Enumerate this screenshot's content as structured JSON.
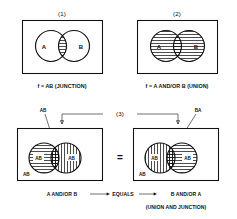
{
  "figure": {
    "title_number_1": "(1)",
    "title_number_2": "(2)",
    "title_number_3": "(3)",
    "panel1": {
      "number": "(1)",
      "circle_a_label": "A",
      "circle_b_label": "B",
      "caption": "f = AB (JUNCTION)",
      "shading": "intersection-only",
      "hatch_style": "horizontal"
    },
    "panel2": {
      "number": "(2)",
      "circle_a_label": "A",
      "circle_b_label": "B",
      "caption": "f = A AND/OR B (UNION)",
      "shading": "both-circles",
      "hatch_style": "horizontal"
    },
    "panel3": {
      "number": "(3)",
      "left_pointer_label": "AB",
      "right_pointer_label": "BA",
      "equals_symbol": "=",
      "left_box": {
        "circle_a_label": "AB",
        "circle_b_label": "AB",
        "corner_label": "AB",
        "circle_a_hatch": "horizontal",
        "circle_b_hatch": "vertical"
      },
      "right_box": {
        "circle_a_label": "AB",
        "circle_b_label": "AB",
        "corner_label": "AB",
        "circle_a_hatch": "vertical",
        "circle_b_hatch": "horizontal"
      },
      "caption_left": "A AND/OR B",
      "caption_middle": "EQUALS",
      "caption_right": "B AND/OR A",
      "caption_bottom": "(UNION AND JUNCTION)"
    },
    "colors": {
      "ink": "#111111",
      "paper": "#ffffff"
    }
  }
}
